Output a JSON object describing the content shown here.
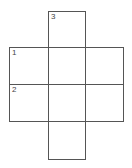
{
  "puzzle": {
    "type": "crossword-grid",
    "cells": [
      {
        "row": 0,
        "col": 1,
        "number": "3"
      },
      {
        "row": 1,
        "col": 0,
        "number": "1"
      },
      {
        "row": 1,
        "col": 1,
        "number": ""
      },
      {
        "row": 1,
        "col": 2,
        "number": ""
      },
      {
        "row": 2,
        "col": 0,
        "number": "2"
      },
      {
        "row": 2,
        "col": 1,
        "number": ""
      },
      {
        "row": 2,
        "col": 2,
        "number": ""
      },
      {
        "row": 3,
        "col": 1,
        "number": ""
      }
    ]
  }
}
